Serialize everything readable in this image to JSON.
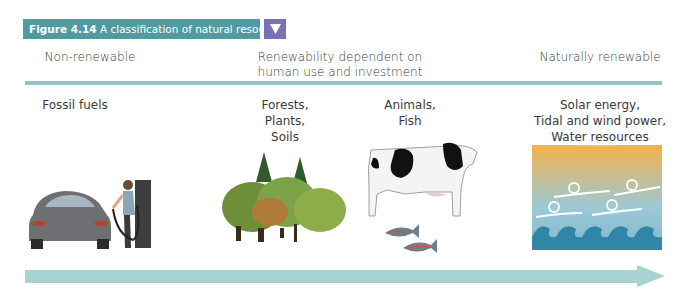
{
  "figure": {
    "label": "Figure 4.14",
    "title": "A classification of natural resources",
    "dropdown_icon": "triangle-down-icon"
  },
  "categories": [
    {
      "label": "Non-renewable"
    },
    {
      "label_line1": "Renewability dependent on",
      "label_line2": "human use and investment"
    },
    {
      "label": "Naturally renewable"
    }
  ],
  "examples": [
    {
      "lines": [
        "Fossil fuels"
      ],
      "image": "car-refuelling-illustration"
    },
    {
      "lines": [
        "Forests,",
        "Plants,",
        "Soils"
      ],
      "image": "trees-illustration"
    },
    {
      "lines": [
        "Animals,",
        "Fish"
      ],
      "image": "cow-and-fish-illustration"
    },
    {
      "lines": [
        "Solar energy,",
        "Tidal and wind power,",
        "Water resources"
      ],
      "image": "sun-wind-waves-illustration"
    }
  ],
  "colors": {
    "banner": "#4f9b9f",
    "dropdown": "#7a70b5",
    "divider": "#8fc6c4",
    "arrow": "#9fd0cd"
  }
}
